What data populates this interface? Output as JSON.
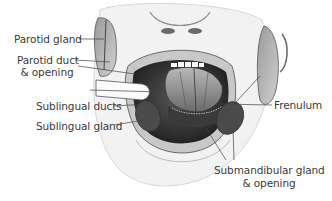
{
  "figure": {
    "style": "grayscale pencil anatomical illustration",
    "colors": {
      "background": "#ffffff",
      "label_text": "#3a3a3a",
      "leader_line": "#444444",
      "gland_dark": "#4a4a4a",
      "skin": "#e8e8e8"
    }
  },
  "labels": {
    "parotid_gland": "Parotid gland",
    "parotid_duct_line1": "Parotid duct",
    "parotid_duct_line2": "& opening",
    "sublingual_ducts": "Sublingual ducts",
    "sublingual_gland": "Sublingual gland",
    "frenulum": "Frenulum",
    "submandibular_line1": "Submandibular gland",
    "submandibular_line2": "& opening"
  }
}
